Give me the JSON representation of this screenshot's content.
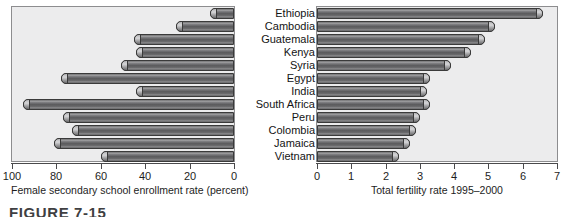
{
  "figure": {
    "caption": "FIGURE 7-15"
  },
  "chart_data": [
    {
      "id": "left",
      "type": "bar",
      "orientation": "horizontal",
      "direction": "right-to-left",
      "title": "",
      "xlabel": "Female secondary school enrollment rate (percent)",
      "ylabel": "",
      "xlim": [
        100,
        0
      ],
      "xticks": [
        100,
        80,
        60,
        40,
        20,
        0
      ],
      "xticklabels": [
        "100",
        "80",
        "60",
        "40",
        "20",
        "0"
      ],
      "grid": false,
      "legend": null,
      "categories": [
        "Ethiopia",
        "Cambodia",
        "Guatemala",
        "Kenya",
        "Syria",
        "Egypt",
        "India",
        "South Africa",
        "Peru",
        "Colombia",
        "Jamaica",
        "Vietnam"
      ],
      "values": [
        11,
        26,
        45,
        44,
        51,
        78,
        44,
        95,
        77,
        73,
        81,
        60
      ]
    },
    {
      "id": "right",
      "type": "bar",
      "orientation": "horizontal",
      "direction": "left-to-right",
      "title": "",
      "xlabel": "Total fertility rate 1995–2000",
      "ylabel": "",
      "xlim": [
        0,
        7
      ],
      "xticks": [
        0,
        1,
        2,
        3,
        4,
        5,
        6,
        7
      ],
      "xticklabels": [
        "0",
        "1",
        "2",
        "3",
        "4",
        "5",
        "6",
        "7"
      ],
      "grid": false,
      "legend": null,
      "categories": [
        "Ethiopia",
        "Cambodia",
        "Guatemala",
        "Kenya",
        "Syria",
        "Egypt",
        "India",
        "South Africa",
        "Peru",
        "Colombia",
        "Jamaica",
        "Vietnam"
      ],
      "values": [
        6.6,
        5.2,
        4.9,
        4.5,
        3.9,
        3.3,
        3.2,
        3.3,
        3.0,
        2.9,
        2.7,
        2.4,
        2.5
      ]
    }
  ],
  "countries": [
    "Ethiopia",
    "Cambodia",
    "Guatemala",
    "Kenya",
    "Syria",
    "Egypt",
    "India",
    "South Africa",
    "Peru",
    "Colombia",
    "Jamaica",
    "Vietnam"
  ]
}
